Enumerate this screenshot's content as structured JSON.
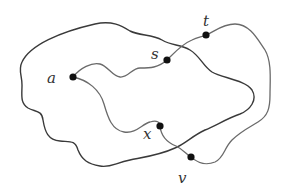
{
  "diagram": {
    "type": "graph-paths-in-region",
    "colors": {
      "outer_curve": "#3a3a3a",
      "path": "#6a6a6a",
      "vertex": "#111111",
      "label": "#333333",
      "background": "#ffffff"
    },
    "vertices": [
      {
        "id": "a",
        "label": "a",
        "x": 73,
        "y": 77,
        "label_x": 47,
        "label_y": 83
      },
      {
        "id": "s",
        "label": "s",
        "x": 167,
        "y": 60,
        "label_x": 151,
        "label_y": 59
      },
      {
        "id": "t",
        "label": "t",
        "x": 206,
        "y": 35,
        "label_x": 203,
        "label_y": 26
      },
      {
        "id": "x",
        "label": "x",
        "x": 160,
        "y": 126,
        "label_x": 143,
        "label_y": 139
      },
      {
        "id": "v",
        "label": "v",
        "x": 191,
        "y": 157,
        "label_x": 178,
        "label_y": 183
      }
    ],
    "curves": [
      {
        "id": "outer-boundary",
        "description": "closed wavy outer curve"
      },
      {
        "id": "path-a-s-t-v",
        "description": "path from a through s and t around right side to v"
      },
      {
        "id": "path-a-x-v",
        "description": "path from a through x to v"
      }
    ]
  }
}
